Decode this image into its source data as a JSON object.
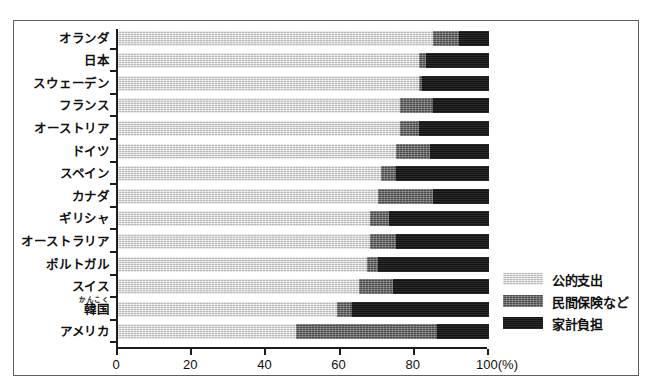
{
  "chart_data": {
    "type": "bar",
    "orientation": "horizontal",
    "stacked": true,
    "title": "",
    "subtitle": "",
    "xlabel": "(%)",
    "ylabel": "",
    "xlim": [
      0,
      100
    ],
    "xticks": [
      0,
      20,
      40,
      60,
      80,
      100
    ],
    "xtick_labels": [
      "0",
      "20",
      "40",
      "60",
      "80",
      "100(%)"
    ],
    "grid": false,
    "legend_position": "right",
    "categories": [
      "オランダ",
      "日本",
      "スウェーデン",
      "フランス",
      "オーストリア",
      "ドイツ",
      "スペイン",
      "カナダ",
      "ギリシャ",
      "オーストラリア",
      "ポルトガル",
      "スイス",
      "韓国",
      "アメリカ"
    ],
    "category_rubies": [
      "",
      "",
      "",
      "",
      "",
      "",
      "",
      "",
      "",
      "",
      "",
      "",
      "かんこく",
      ""
    ],
    "series": [
      {
        "name": "公的支出",
        "color": "#dcdcdc",
        "values": [
          85,
          81,
          81,
          76,
          76,
          75,
          71,
          70,
          68,
          68,
          67,
          65,
          59,
          48
        ]
      },
      {
        "name": "民間保険など",
        "color": "#6a6a6a",
        "values": [
          7,
          2,
          1,
          9,
          5,
          9,
          4,
          15,
          5,
          7,
          3,
          9,
          4,
          38
        ]
      },
      {
        "name": "家計負担",
        "color": "#1a1a1a",
        "values": [
          8,
          17,
          18,
          15,
          19,
          16,
          25,
          15,
          27,
          25,
          30,
          26,
          37,
          14
        ]
      }
    ]
  },
  "legend": {
    "items": [
      {
        "label": "公的支出",
        "swatch": "public-spending-swatch"
      },
      {
        "label": "民間保険など",
        "swatch": "private-insurance-swatch"
      },
      {
        "label": "家計負担",
        "swatch": "household-burden-swatch"
      }
    ]
  },
  "axis": {
    "x_unit_label": "(%)"
  }
}
